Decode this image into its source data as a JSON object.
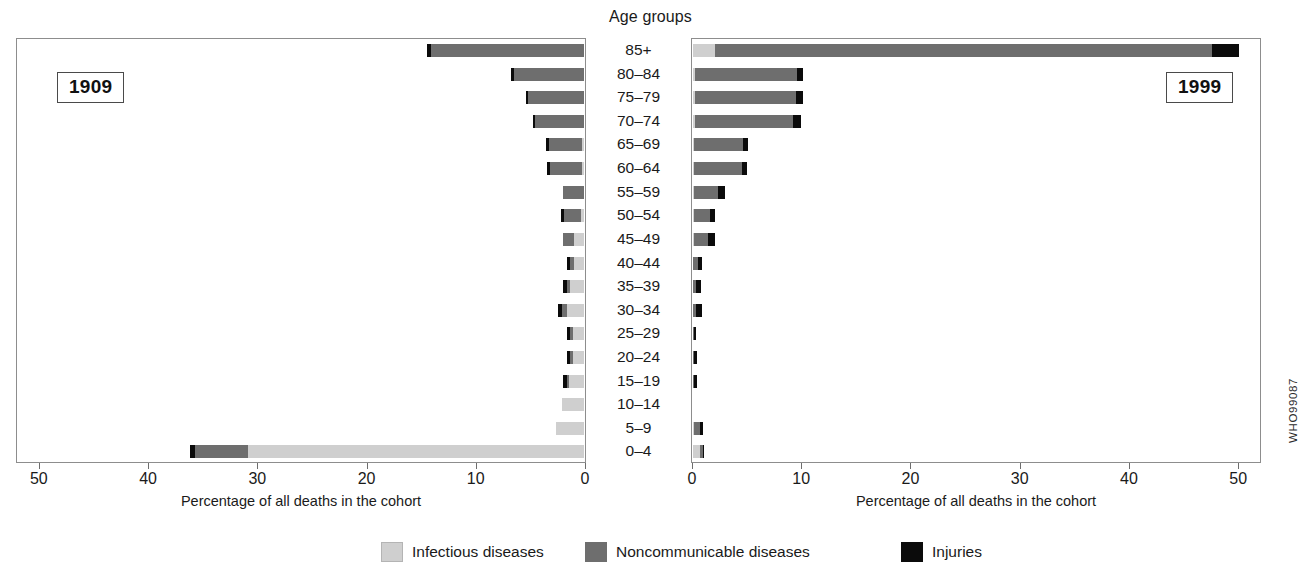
{
  "figure": {
    "center_title": "Age groups",
    "axis_title": "Percentage of all deaths in the cohort",
    "who_code": "WHO99087",
    "ghost_top_text": ""
  },
  "panels": {
    "left": {
      "year_label": "1909",
      "direction": "rtl"
    },
    "right": {
      "year_label": "1999",
      "direction": "ltr"
    }
  },
  "legend": {
    "items": [
      {
        "label": "Infectious diseases",
        "key": "inf",
        "color": "#cfcfcf"
      },
      {
        "label": "Noncommunicable diseases",
        "key": "ncd",
        "color": "#6e6e6e"
      },
      {
        "label": "Injuries",
        "key": "inj",
        "color": "#0b0b0b"
      }
    ]
  },
  "axis": {
    "ticks_left": [
      "50",
      "40",
      "30",
      "20",
      "10",
      "0"
    ],
    "ticks_right": [
      "0",
      "10",
      "20",
      "30",
      "40",
      "50"
    ],
    "min": 0,
    "max": 52
  },
  "chart_data": {
    "type": "bar",
    "title": "Age groups",
    "subtitle": "Percentage of all deaths in the cohort, 1909 vs 1999",
    "xlabel": "Percentage of all deaths in the cohort",
    "ylabel": "Age groups",
    "xlim": [
      0,
      52
    ],
    "grid": false,
    "legend_position": "bottom",
    "orientation": "horizontal-diverging",
    "categories": [
      "85+",
      "80–84",
      "75–79",
      "70–74",
      "65–69",
      "60–64",
      "55–59",
      "50–54",
      "45–49",
      "40–44",
      "35–39",
      "30–34",
      "25–29",
      "20–24",
      "15–19",
      "10–14",
      "5–9",
      "0–4"
    ],
    "series_names": [
      "Infectious diseases",
      "Noncommunicable diseases",
      "Injuries"
    ],
    "panels": [
      {
        "name": "1909",
        "series": [
          {
            "name": "Infectious diseases",
            "values": [
              0.0,
              0.0,
              0.0,
              0.0,
              0.2,
              0.2,
              0.0,
              0.3,
              0.9,
              0.9,
              1.3,
              1.6,
              1.0,
              1.0,
              1.4,
              2.0,
              2.6,
              30.8
            ]
          },
          {
            "name": "Noncommunicable diseases",
            "values": [
              14.0,
              6.4,
              5.1,
              4.5,
              3.0,
              2.9,
              1.9,
              1.5,
              1.0,
              0.4,
              0.3,
              0.4,
              0.3,
              0.3,
              0.2,
              0.0,
              0.0,
              4.8
            ]
          },
          {
            "name": "Injuries",
            "values": [
              0.4,
              0.3,
              0.2,
              0.2,
              0.3,
              0.3,
              0.0,
              0.3,
              0.0,
              0.3,
              0.3,
              0.4,
              0.3,
              0.3,
              0.3,
              0.0,
              0.0,
              0.5
            ]
          }
        ],
        "totals": [
          14.4,
          6.7,
          5.3,
          4.7,
          3.5,
          3.4,
          1.9,
          2.1,
          1.9,
          1.6,
          1.9,
          2.4,
          1.6,
          1.6,
          1.9,
          2.0,
          2.6,
          36.1
        ]
      },
      {
        "name": "1999",
        "series": [
          {
            "name": "Infectious diseases",
            "values": [
              2.0,
              0.2,
              0.2,
              0.2,
              0.1,
              0.1,
              0.1,
              0.1,
              0.1,
              0.0,
              0.0,
              0.0,
              0.0,
              0.0,
              0.0,
              0.0,
              0.1,
              0.6
            ]
          },
          {
            "name": "Noncommunicable diseases",
            "values": [
              45.5,
              9.3,
              9.2,
              9.0,
              4.5,
              4.4,
              2.2,
              1.5,
              1.3,
              0.5,
              0.3,
              0.3,
              0.1,
              0.1,
              0.1,
              0.0,
              0.5,
              0.3
            ]
          },
          {
            "name": "Injuries",
            "values": [
              2.5,
              0.6,
              0.7,
              0.7,
              0.4,
              0.4,
              0.6,
              0.4,
              0.6,
              0.3,
              0.4,
              0.5,
              0.2,
              0.3,
              0.3,
              0.0,
              0.3,
              0.1
            ]
          }
        ],
        "totals": [
          50.0,
          10.1,
          10.1,
          9.9,
          5.0,
          4.9,
          2.9,
          2.0,
          2.0,
          0.8,
          0.7,
          0.8,
          0.3,
          0.4,
          0.4,
          0.0,
          0.9,
          1.0
        ]
      }
    ]
  }
}
